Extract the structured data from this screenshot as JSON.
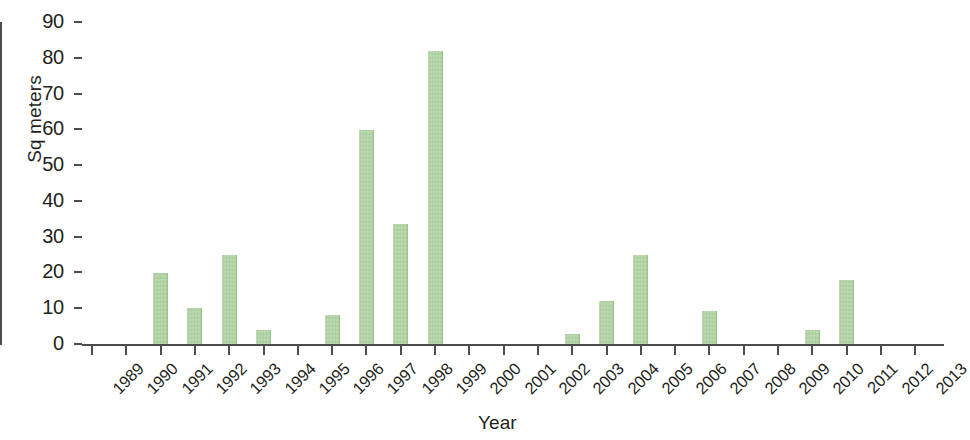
{
  "chart_data": {
    "type": "bar",
    "title": "",
    "xlabel": "Year",
    "ylabel": "Sq meters",
    "ylim": [
      0,
      90
    ],
    "yticks": [
      0,
      10,
      20,
      30,
      40,
      50,
      60,
      70,
      80,
      90
    ],
    "ytick_labels": [
      "0",
      "10",
      "20",
      "30",
      "40",
      "50",
      "60",
      "70",
      "80",
      "90"
    ],
    "grid": false,
    "legend": null,
    "bar_color": "#a9cf9b",
    "axis_color": "#4d4d4d",
    "categories": [
      "1989",
      "1990",
      "1991",
      "1992",
      "1993",
      "1994",
      "1995",
      "1996",
      "1997",
      "1998",
      "1999",
      "2000",
      "2001",
      "2002",
      "2003",
      "2004",
      "2005",
      "2006",
      "2007",
      "2008",
      "2009",
      "2010",
      "2011",
      "2012",
      "2013"
    ],
    "values": [
      0,
      0,
      19.8,
      10,
      24.8,
      4,
      0,
      8,
      59.7,
      33.6,
      81.8,
      0,
      0,
      0,
      2.8,
      12,
      25,
      0,
      9.2,
      0,
      0,
      4,
      18,
      0,
      0
    ]
  }
}
